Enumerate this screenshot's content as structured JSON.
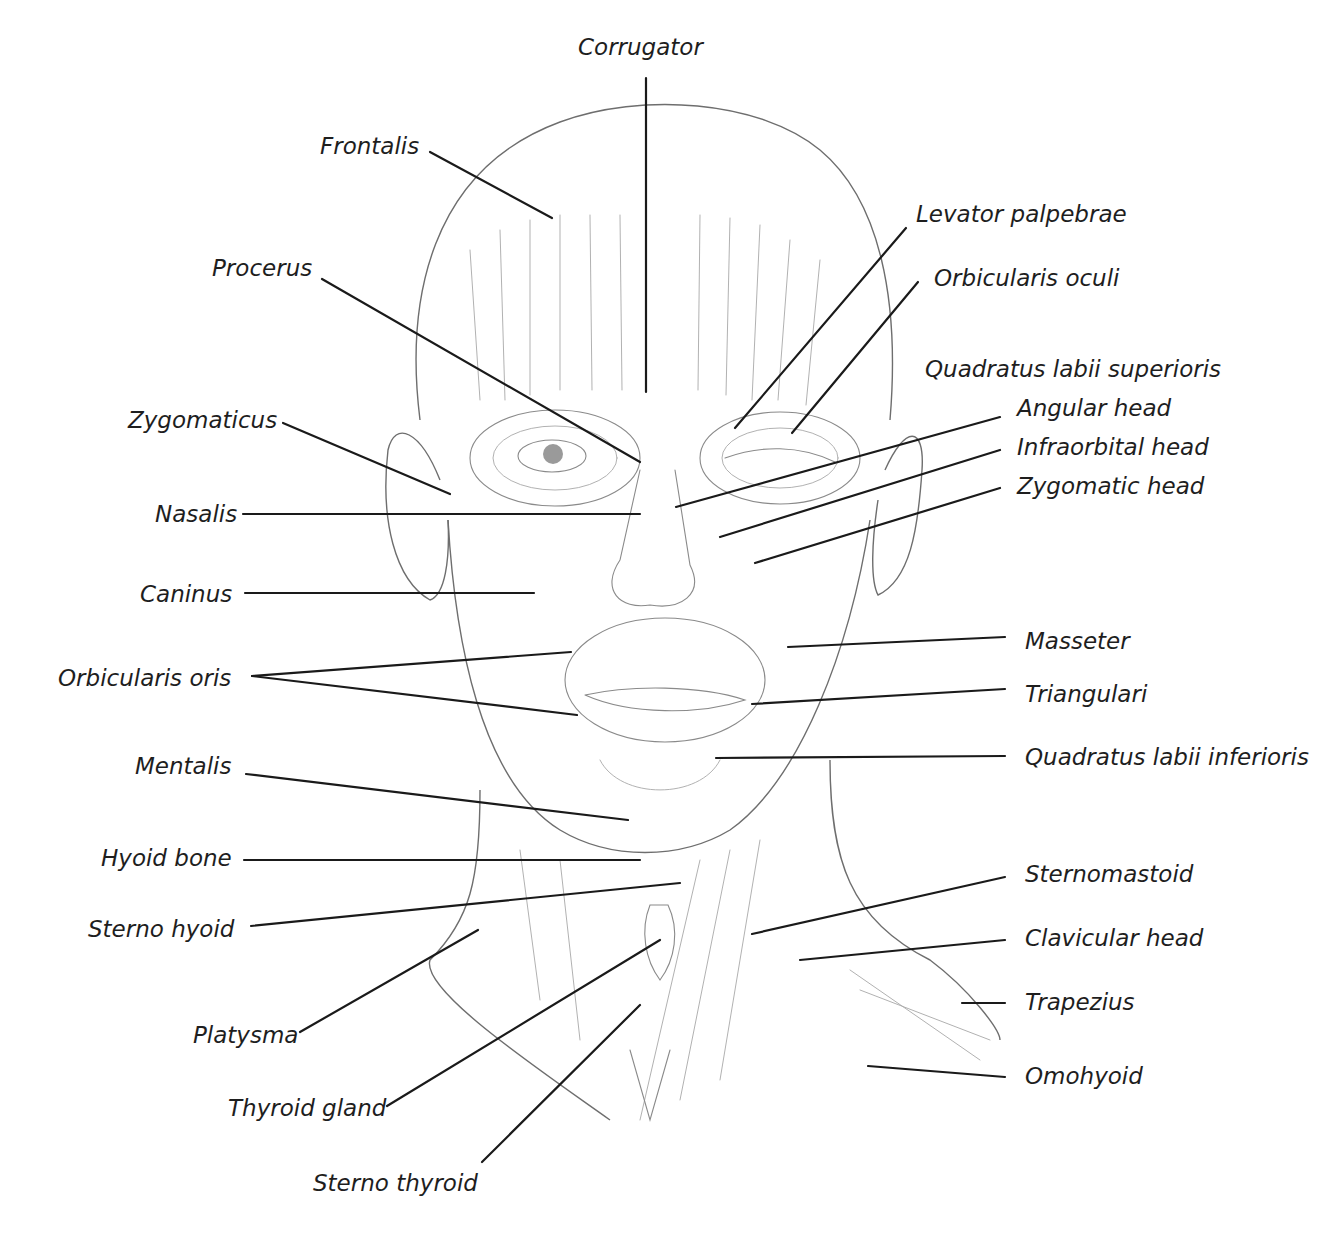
{
  "diagram": {
    "left_labels": [
      {
        "id": "frontalis",
        "text": "Frontalis",
        "x": 320,
        "y": 154,
        "line": [
          430,
          152,
          552,
          218
        ]
      },
      {
        "id": "procerus",
        "text": "Procerus",
        "x": 212,
        "y": 276,
        "line": [
          322,
          279,
          640,
          462
        ]
      },
      {
        "id": "zygomaticus",
        "text": "Zygomaticus",
        "x": 128,
        "y": 428,
        "line": [
          283,
          423,
          450,
          494
        ]
      },
      {
        "id": "nasalis",
        "text": "Nasalis",
        "x": 155,
        "y": 522,
        "line": [
          243,
          514,
          640,
          514
        ]
      },
      {
        "id": "caninus",
        "text": "Caninus",
        "x": 140,
        "y": 602,
        "line": [
          245,
          593,
          534,
          593
        ]
      },
      {
        "id": "orbicularis-oris",
        "text": "Orbicularis oris",
        "x": 58,
        "y": 686,
        "lines": [
          [
            252,
            676,
            571,
            652
          ],
          [
            252,
            676,
            577,
            715
          ]
        ]
      },
      {
        "id": "mentalis",
        "text": "Mentalis",
        "x": 135,
        "y": 774,
        "line": [
          246,
          774,
          628,
          820
        ]
      },
      {
        "id": "hyoid-bone",
        "text": "Hyoid bone",
        "x": 101,
        "y": 866,
        "line": [
          244,
          860,
          640,
          860
        ]
      },
      {
        "id": "sterno-hyoid",
        "text": "Sterno hyoid",
        "x": 88,
        "y": 937,
        "line": [
          251,
          926,
          680,
          883
        ]
      },
      {
        "id": "platysma",
        "text": "Platysma",
        "x": 193,
        "y": 1043,
        "line": [
          300,
          1032,
          478,
          930
        ]
      },
      {
        "id": "thyroid-gland",
        "text": "Thyroid gland",
        "x": 228,
        "y": 1116,
        "line": [
          387,
          1106,
          660,
          940
        ]
      },
      {
        "id": "sterno-thyroid",
        "text": "Sterno thyroid",
        "x": 313,
        "y": 1191,
        "line": [
          482,
          1162,
          640,
          1005
        ]
      }
    ],
    "top_labels": [
      {
        "id": "corrugator",
        "text": "Corrugator",
        "x": 578,
        "y": 55,
        "line": [
          646,
          78,
          646,
          392
        ]
      }
    ],
    "right_labels": [
      {
        "id": "levator-palpebrae",
        "text": "Levator palpebrae",
        "x": 916,
        "y": 222,
        "line": [
          906,
          228,
          735,
          428
        ]
      },
      {
        "id": "orbicularis-oculi",
        "text": "Orbicularis oculi",
        "x": 934,
        "y": 286,
        "line": [
          918,
          282,
          792,
          433
        ]
      },
      {
        "id": "quadratus-labii-superioris",
        "text": "Quadratus labii superioris",
        "x": 925,
        "y": 377
      },
      {
        "id": "angular-head",
        "text": "Angular head",
        "x": 1017,
        "y": 416,
        "line": [
          1000,
          417,
          676,
          507
        ]
      },
      {
        "id": "infraorbital-head",
        "text": "Infraorbital head",
        "x": 1017,
        "y": 455,
        "line": [
          1000,
          450,
          720,
          537
        ]
      },
      {
        "id": "zygomatic-head",
        "text": "Zygomatic head",
        "x": 1017,
        "y": 494,
        "line": [
          1000,
          488,
          755,
          563
        ]
      },
      {
        "id": "masseter",
        "text": "Masseter",
        "x": 1025,
        "y": 649,
        "line": [
          1005,
          637,
          788,
          647
        ]
      },
      {
        "id": "triangulari",
        "text": "Triangulari",
        "x": 1025,
        "y": 702,
        "line": [
          1005,
          689,
          752,
          704
        ]
      },
      {
        "id": "quadratus-labii-inferioris",
        "text": "Quadratus labii inferioris",
        "x": 1025,
        "y": 765,
        "line": [
          1005,
          756,
          716,
          758
        ]
      },
      {
        "id": "sternomastoid",
        "text": "Sternomastoid",
        "x": 1025,
        "y": 882,
        "line": [
          1005,
          877,
          752,
          934
        ]
      },
      {
        "id": "clavicular-head",
        "text": "Clavicular head",
        "x": 1025,
        "y": 946,
        "line": [
          1005,
          940,
          800,
          960
        ]
      },
      {
        "id": "trapezius",
        "text": "Trapezius",
        "x": 1025,
        "y": 1010,
        "line": [
          1005,
          1003,
          962,
          1003
        ]
      },
      {
        "id": "omohyoid",
        "text": "Omohyoid",
        "x": 1025,
        "y": 1084,
        "line": [
          1005,
          1077,
          868,
          1066
        ]
      }
    ],
    "colors": {
      "background": "#ffffff",
      "label_text": "#1e1e1e",
      "leader_line": "#1a1a1a",
      "sketch": "#8a8a8a"
    }
  }
}
